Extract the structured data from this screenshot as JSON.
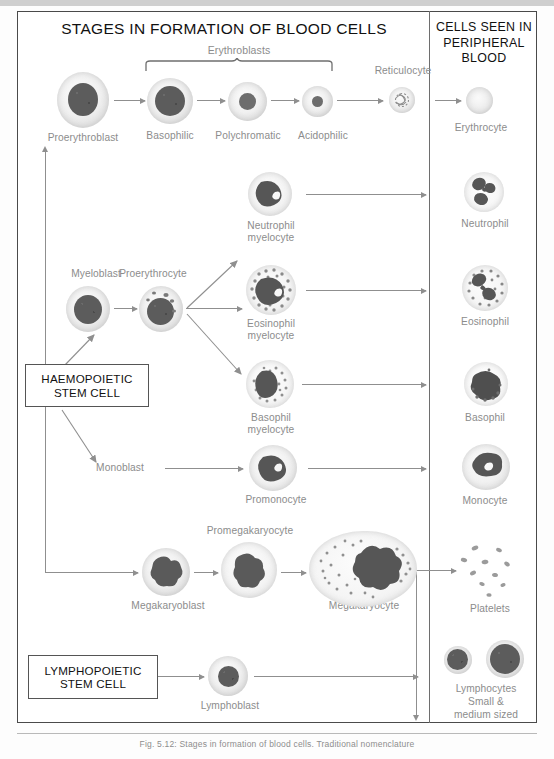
{
  "figure": {
    "main_title": "STAGES IN FORMATION OF BLOOD CELLS",
    "right_title": "CELLS SEEN IN\nPERIPHERAL\nBLOOD",
    "caption": "Fig. 5.12: Stages in formation of blood cells. Traditional nomenclature"
  },
  "boxes": {
    "haemopoietic": "HAEMOPOIETIC\nSTEM CELL",
    "lymphopoietic": "LYMPHOPOIETIC\nSTEM CELL"
  },
  "brackets": {
    "erythroblasts": "Erythroblasts"
  },
  "erythroid": {
    "proerythroblast": "Proerythroblast",
    "basophilic": "Basophilic",
    "polychromatic": "Polychromatic",
    "acidophilic": "Acidophilic",
    "reticulocyte": "Reticulocyte",
    "erythrocyte": "Erythrocyte"
  },
  "myeloid": {
    "myeloblast": "Myeloblast",
    "proerythrocyte": "Proerythrocyte",
    "neutrophil_myelocyte": "Neutrophil\nmyelocyte",
    "eosinophil_myelocyte": "Eosinophil\nmyelocyte",
    "basophil_myelocyte": "Basophil\nmyelocyte",
    "monoblast": "Monoblast",
    "promonocyte": "Promonocyte"
  },
  "megakaryocytic": {
    "megakaryoblast": "Megakaryoblast",
    "promegakaryocyte": "Promegakaryocyte",
    "megakaryocyte": "Megakaryocyte"
  },
  "lymphoid": {
    "lymphoblast": "Lymphoblast"
  },
  "peripheral": {
    "erythrocyte": "Erythrocyte",
    "neutrophil": "Neutrophil",
    "eosinophil": "Eosinophil",
    "basophil": "Basophil",
    "monocyte": "Monocyte",
    "platelets": "Platelets",
    "lymphocytes": "Lymphocytes\nSmall &\nmedium sized"
  },
  "colors": {
    "frame": "#4a4a4a",
    "arrow": "#8f8f8f",
    "label_text": "#8c8c8c",
    "title_text": "#111111",
    "nucleus": "#5a5a5a",
    "cytoplasm": "#eeeeee",
    "background": "#ffffff"
  }
}
